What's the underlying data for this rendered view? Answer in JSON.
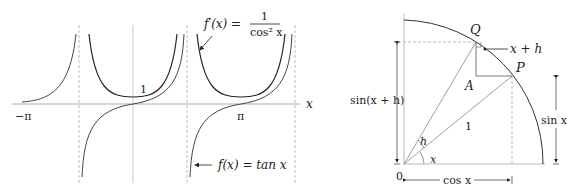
{
  "left_plot": {
    "axis_label_x": "x",
    "tick_neg_pi": "−π",
    "tick_pi": "π",
    "label_one": "1",
    "deriv_label": {
      "lhs": "f′(x) =",
      "num": "1",
      "den": "cos² x"
    },
    "func_label": "f(x) = tan x"
  },
  "right_plot": {
    "label_Q": "Q",
    "label_P": "P",
    "label_A": "A",
    "label_xh": "x + h",
    "label_one": "1",
    "label_h": "h",
    "label_x": "x",
    "label_zero": "0",
    "label_sin_xh": "sin(x + h)",
    "label_sin_x": "sin x",
    "label_cos_x": "cos x"
  }
}
